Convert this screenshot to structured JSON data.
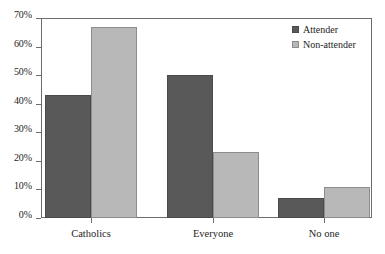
{
  "chart_data": {
    "type": "bar",
    "title": "",
    "subtitle": "",
    "xlabel": "",
    "ylabel": "",
    "categories": [
      "Catholics",
      "Everyone",
      "No one"
    ],
    "series": [
      {
        "name": "Attender",
        "color": "#595959",
        "values": [
          43,
          50,
          7
        ]
      },
      {
        "name": "Non-attender",
        "color": "#b8b8b8",
        "values": [
          67,
          23,
          11
        ]
      }
    ],
    "ylim": [
      0,
      70
    ],
    "ytick_values": [
      0,
      10,
      20,
      30,
      40,
      50,
      60,
      70
    ],
    "ytick_labels": [
      "0%",
      "10%",
      "20%",
      "30%",
      "40%",
      "50%",
      "60%",
      "70%"
    ],
    "grid": false,
    "legend_position": "top-right",
    "value_suffix": "%"
  },
  "legend": {
    "items": [
      {
        "label": "Attender",
        "swatch": "attender-swatch"
      },
      {
        "label": "Non-attender",
        "swatch": "nonattender-swatch"
      }
    ]
  }
}
